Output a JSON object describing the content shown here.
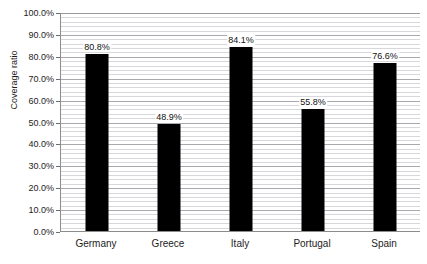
{
  "chart_data": {
    "type": "bar",
    "title": "",
    "xlabel": "",
    "ylabel": "Coverage ratio",
    "categories": [
      "Germany",
      "Greece",
      "Italy",
      "Portugal",
      "Spain"
    ],
    "values": [
      80.8,
      48.9,
      84.1,
      55.8,
      76.6
    ],
    "value_labels": [
      "80.8%",
      "48.9%",
      "84.1%",
      "55.8%",
      "76.6%"
    ],
    "ylim": [
      0,
      100
    ],
    "ytick_labels": [
      "0.0%",
      "10.0%",
      "20.0%",
      "30.0%",
      "40.0%",
      "50.0%",
      "60.0%",
      "70.0%",
      "80.0%",
      "90.0%",
      "100.0%"
    ],
    "ytick_values": [
      0,
      10,
      20,
      30,
      40,
      50,
      60,
      70,
      80,
      90,
      100
    ],
    "grid": true,
    "minor_grid_step": 2,
    "legend": null,
    "bar_color": "#000000",
    "grid_color": "#d8d8dc",
    "axis_color": "#8c8c8c",
    "background_color": "#ffffff"
  }
}
